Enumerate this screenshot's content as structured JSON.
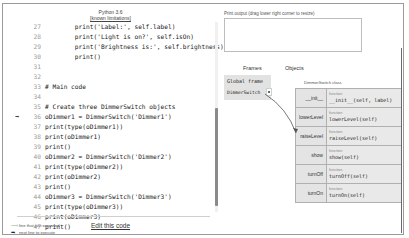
{
  "code_panel": {
    "title": "Python 3.6",
    "limitations_link": "[known limitations]",
    "lines": [
      {
        "no": "27",
        "src": "        print('Label:', self.label)",
        "arrow": ""
      },
      {
        "no": "28",
        "src": "        print('Light is on?', self.isOn)",
        "arrow": ""
      },
      {
        "no": "29",
        "src": "        print('Brightness is:', self.brightness)",
        "arrow": ""
      },
      {
        "no": "30",
        "src": "        print()",
        "arrow": ""
      },
      {
        "no": "31",
        "src": "",
        "arrow": ""
      },
      {
        "no": "32",
        "src": "",
        "arrow": ""
      },
      {
        "no": "33",
        "src": "# Main code",
        "arrow": ""
      },
      {
        "no": "34",
        "src": "",
        "arrow": ""
      },
      {
        "no": "35",
        "src": "# Create three DimmerSwitch objects",
        "arrow": ""
      },
      {
        "no": "36",
        "src": "oDimmer1 = DimmerSwitch('Dimmer1')",
        "arrow": "➡"
      },
      {
        "no": "37",
        "src": "print(type(oDimmer1))",
        "arrow": ""
      },
      {
        "no": "38",
        "src": "print(oDimmer1)",
        "arrow": ""
      },
      {
        "no": "39",
        "src": "print()",
        "arrow": ""
      },
      {
        "no": "40",
        "src": "oDimmer2 = DimmerSwitch('Dimmer2')",
        "arrow": ""
      },
      {
        "no": "41",
        "src": "print(type(oDimmer2))",
        "arrow": ""
      },
      {
        "no": "42",
        "src": "print(oDimmer2)",
        "arrow": ""
      },
      {
        "no": "43",
        "src": "print()",
        "arrow": ""
      },
      {
        "no": "44",
        "src": "oDimmer3 = DimmerSwitch('Dimmer3')",
        "arrow": ""
      },
      {
        "no": "45",
        "src": "print(type(oDimmer3))",
        "arrow": ""
      },
      {
        "no": "46",
        "src": "print(oDimmer3)",
        "arrow": ""
      },
      {
        "no": "47",
        "src": "print()",
        "arrow": ""
      }
    ],
    "edit_link": "Edit this code",
    "legend": {
      "prev_arrow": "⟶",
      "prev_label": "line that just executed",
      "next_arrow": "➡",
      "next_label": "next line to execute"
    }
  },
  "output_panel": {
    "print_label": "Print output (drag lower right corner to resize)",
    "print_value": "",
    "frames_title": "Frames",
    "objects_title": "Objects",
    "global_frame": {
      "name": "Global frame",
      "variable": "DimmerSwitch"
    },
    "class_object": {
      "label": "DimmerSwitch class",
      "methods": [
        {
          "name": "__init__",
          "type": "function",
          "signature": "__init__(self, label)"
        },
        {
          "name": "lowerLevel",
          "type": "function",
          "signature": "lowerLevel(self)"
        },
        {
          "name": "raiseLevel",
          "type": "function",
          "signature": "raiseLevel(self)"
        },
        {
          "name": "show",
          "type": "function",
          "signature": "show(self)"
        },
        {
          "name": "turnOff",
          "type": "function",
          "signature": "turnOff(self)"
        },
        {
          "name": "turnOn",
          "type": "function",
          "signature": "turnOn(self)"
        }
      ]
    }
  }
}
